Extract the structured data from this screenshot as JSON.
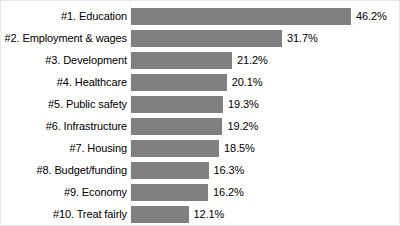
{
  "chart_data": {
    "type": "bar",
    "orientation": "horizontal",
    "title": "",
    "subtitle": "",
    "xlabel": "",
    "ylabel": "",
    "grid": false,
    "legend": null,
    "legend_position": "none",
    "xlim": [
      0,
      46.2
    ],
    "bar_color": "#808080",
    "value_suffix": "%",
    "categories": [
      "#1. Education",
      "#2. Employment & wages",
      "#3. Development",
      "#4. Healthcare",
      "#5. Public safety",
      "#6. Infrastructure",
      "#7. Housing",
      "#8. Budget/funding",
      "#9. Economy",
      "#10. Treat fairly"
    ],
    "values": [
      46.2,
      31.7,
      21.2,
      20.1,
      19.3,
      19.2,
      18.5,
      16.3,
      16.2,
      12.1
    ],
    "value_labels": [
      "46.2%",
      "31.7%",
      "21.2%",
      "20.1%",
      "19.3%",
      "19.2%",
      "18.5%",
      "16.3%",
      "16.2%",
      "12.1%"
    ]
  }
}
